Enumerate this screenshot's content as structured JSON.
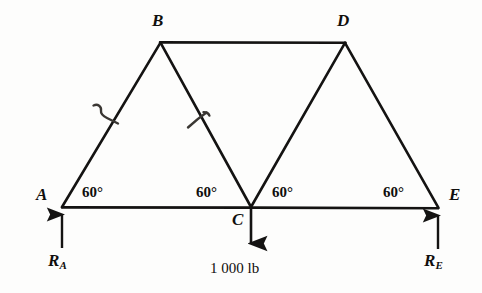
{
  "figure": {
    "kind": "truss-free-body-diagram",
    "width": 482,
    "height": 293,
    "line_color": "#141312",
    "text_color": "#100f0d",
    "background": "#fdfdfc"
  },
  "nodes": [
    {
      "id": "A",
      "label": "A",
      "x": 62,
      "y": 207,
      "label_x": 36,
      "label_y": 186
    },
    {
      "id": "B",
      "label": "B",
      "x": 160,
      "y": 42,
      "label_x": 152,
      "label_y": 12
    },
    {
      "id": "C",
      "label": "C",
      "x": 251,
      "y": 207,
      "label_x": 232,
      "label_y": 211
    },
    {
      "id": "D",
      "label": "D",
      "x": 345,
      "y": 42,
      "label_x": 337,
      "label_y": 12
    },
    {
      "id": "E",
      "label": "E",
      "x": 438,
      "y": 208,
      "label_x": 449,
      "label_y": 186
    }
  ],
  "members": [
    {
      "name": "AB",
      "from": "A",
      "to": "B"
    },
    {
      "name": "BD",
      "from": "B",
      "to": "D"
    },
    {
      "name": "BC",
      "from": "B",
      "to": "C"
    },
    {
      "name": "CD",
      "from": "C",
      "to": "D"
    },
    {
      "name": "DE",
      "from": "D",
      "to": "E"
    },
    {
      "name": "AE",
      "from": "A",
      "to": "E"
    }
  ],
  "tick_marks": [
    {
      "name": "tick-on-AB",
      "x": 108,
      "y": 115
    },
    {
      "name": "tick-on-BC",
      "x": 199,
      "y": 120
    }
  ],
  "angles": [
    {
      "id": "angle-at-A",
      "value": "60°",
      "x": 82,
      "y": 183
    },
    {
      "id": "angle-at-C-left",
      "value": "60°",
      "x": 196,
      "y": 183
    },
    {
      "id": "angle-at-C-right",
      "value": "60°",
      "x": 272,
      "y": 183
    },
    {
      "id": "angle-at-E",
      "value": "60°",
      "x": 383,
      "y": 183
    }
  ],
  "forces": [
    {
      "id": "applied-load-at-C",
      "label": "1 000 lb",
      "magnitude": 1000,
      "unit": "lb",
      "direction": "down",
      "at_node": "C",
      "tail_x": 251,
      "tail_y": 207,
      "head_x": 251,
      "head_y": 254,
      "label_x": 210,
      "label_y": 261
    }
  ],
  "reactions": [
    {
      "id": "reaction-at-A",
      "symbol": "R",
      "subscript": "A",
      "direction": "up",
      "at_node": "A",
      "tail_x": 62,
      "tail_y": 248,
      "head_x": 62,
      "head_y": 207,
      "label_x": 48,
      "label_y": 252
    },
    {
      "id": "reaction-at-E",
      "symbol": "R",
      "subscript": "E",
      "direction": "up",
      "at_node": "E",
      "tail_x": 438,
      "tail_y": 248,
      "head_x": 438,
      "head_y": 208,
      "label_x": 424,
      "label_y": 252
    }
  ]
}
